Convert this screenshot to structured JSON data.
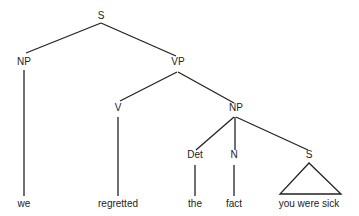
{
  "tree": {
    "nodes": [
      {
        "id": "S",
        "label": "S",
        "x": 101,
        "y": 16
      },
      {
        "id": "NP1",
        "label": "NP",
        "x": 24,
        "y": 61
      },
      {
        "id": "VP",
        "label": "VP",
        "x": 178,
        "y": 61
      },
      {
        "id": "V",
        "label": "V",
        "x": 118,
        "y": 106
      },
      {
        "id": "NP2",
        "label": "NP",
        "x": 236,
        "y": 106
      },
      {
        "id": "Det",
        "label": "Det",
        "x": 195,
        "y": 154
      },
      {
        "id": "N",
        "label": "N",
        "x": 234,
        "y": 154
      },
      {
        "id": "S2",
        "label": "S",
        "x": 309,
        "y": 154
      }
    ],
    "leaves": [
      {
        "id": "we",
        "label": "we",
        "x": 24,
        "y": 201
      },
      {
        "id": "regretted",
        "label": "regretted",
        "x": 118,
        "y": 201
      },
      {
        "id": "the",
        "label": "the",
        "x": 195,
        "y": 201
      },
      {
        "id": "fact",
        "label": "fact",
        "x": 234,
        "y": 201
      },
      {
        "id": "yws",
        "label": "you were sick",
        "x": 309,
        "y": 201
      }
    ]
  }
}
